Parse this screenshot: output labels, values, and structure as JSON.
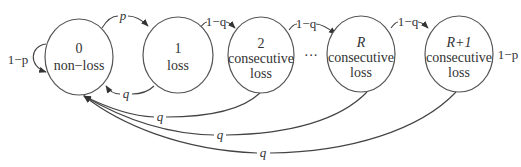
{
  "diagram": {
    "colors": {
      "stroke": "#444444",
      "text": "#333333",
      "background": "#ffffff"
    },
    "states": [
      {
        "id": "s0",
        "line1": "0",
        "line2": "non−loss",
        "line3": ""
      },
      {
        "id": "s1",
        "line1": "1",
        "line2": "loss",
        "line3": ""
      },
      {
        "id": "s2",
        "line1": "2",
        "line2": "consecutive",
        "line3": "loss"
      },
      {
        "id": "sR",
        "line1": "R",
        "line2": "consecutive",
        "line3": "loss"
      },
      {
        "id": "sR1",
        "line1": "R+1",
        "line2": "consecutive",
        "line3": "loss"
      }
    ],
    "ellipsis": "···",
    "edges": [
      {
        "from": "s0",
        "to": "s0",
        "label": "1−p"
      },
      {
        "from": "s0",
        "to": "s1",
        "label": "p"
      },
      {
        "from": "s1",
        "to": "s0",
        "label": "q"
      },
      {
        "from": "s1",
        "to": "s2",
        "label": "1−q"
      },
      {
        "from": "s2",
        "to": "sR",
        "label": "1−q"
      },
      {
        "from": "sR",
        "to": "sR1",
        "label": "1−q"
      },
      {
        "from": "sR1",
        "to": "sR1",
        "label": "1−p"
      },
      {
        "from": "s2",
        "to": "s0",
        "label": "q"
      },
      {
        "from": "sR",
        "to": "s0",
        "label": "q"
      },
      {
        "from": "sR1",
        "to": "s0",
        "label": "q"
      }
    ]
  }
}
